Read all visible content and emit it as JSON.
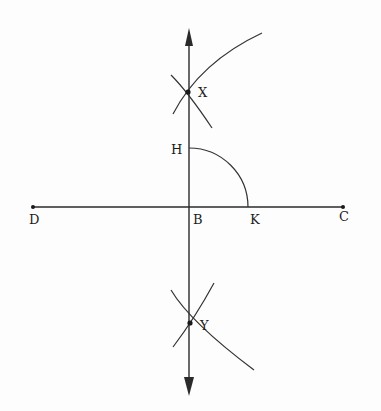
{
  "diagram": {
    "type": "geometric-construction",
    "points": {
      "X": {
        "label": "X"
      },
      "H": {
        "label": "H"
      },
      "B": {
        "label": "B"
      },
      "K": {
        "label": "K"
      },
      "D": {
        "label": "D"
      },
      "C": {
        "label": "C"
      },
      "Y": {
        "label": "Y"
      }
    },
    "elements": [
      {
        "kind": "line",
        "name": "DC",
        "from": "D",
        "to": "C"
      },
      {
        "kind": "line-with-arrows",
        "name": "XY-perpendicular",
        "through": [
          "X",
          "H",
          "B",
          "Y"
        ]
      },
      {
        "kind": "arc",
        "name": "HK",
        "center": "B",
        "from": "H",
        "to": "K"
      },
      {
        "kind": "arc-pair",
        "name": "arcs-at-X",
        "intersection": "X"
      },
      {
        "kind": "arc-pair",
        "name": "arcs-at-Y",
        "intersection": "Y"
      }
    ]
  },
  "colors": {
    "stroke": "#2a2a2a",
    "background": "#fdfdfd"
  }
}
